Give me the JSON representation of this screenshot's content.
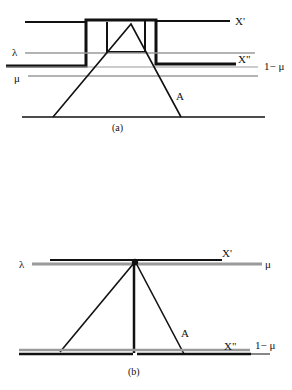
{
  "figure_a": {
    "caption": "(a)",
    "labels": {
      "x_prime": "X'",
      "x_double_prime": "X\"",
      "lambda": "λ",
      "mu": "μ",
      "one_minus_mu": "1− μ",
      "a": "A"
    }
  },
  "figure_b": {
    "caption": "(b)",
    "labels": {
      "x_prime": "X'",
      "x_double_prime": "X\"",
      "lambda": "λ",
      "mu": "μ",
      "one_minus_mu": "1− μ",
      "a": "A"
    }
  },
  "colors": {
    "ink": "#111111",
    "gray_line": "#9a9a9a"
  }
}
